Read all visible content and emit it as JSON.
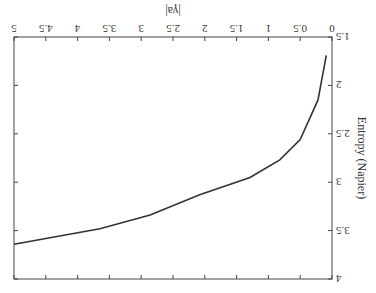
{
  "chart_data": {
    "type": "line",
    "title": "",
    "xlabel": "Entropy (Napier)",
    "ylabel": "|γ_a|",
    "xlim": [
      1.5,
      4
    ],
    "ylim": [
      0,
      5
    ],
    "x_ticks": [
      "1.5",
      "2",
      "2.5",
      "3",
      "3.5",
      "4"
    ],
    "y_ticks": [
      "0",
      "0.5",
      "1",
      "1.5",
      "2",
      "2.5",
      "3",
      "3.5",
      "4",
      "4.5",
      "5"
    ],
    "grid": false,
    "legend": null,
    "orientation_note": "figure rendered rotated 180 degrees",
    "series": [
      {
        "name": "|γ_a| vs entropy",
        "x": [
          1.69,
          2.15,
          2.56,
          2.77,
          2.95,
          3.13,
          3.34,
          3.48,
          3.64
        ],
        "y": [
          0.09,
          0.22,
          0.5,
          0.82,
          1.29,
          2.08,
          2.86,
          3.65,
          5.0
        ]
      }
    ]
  }
}
